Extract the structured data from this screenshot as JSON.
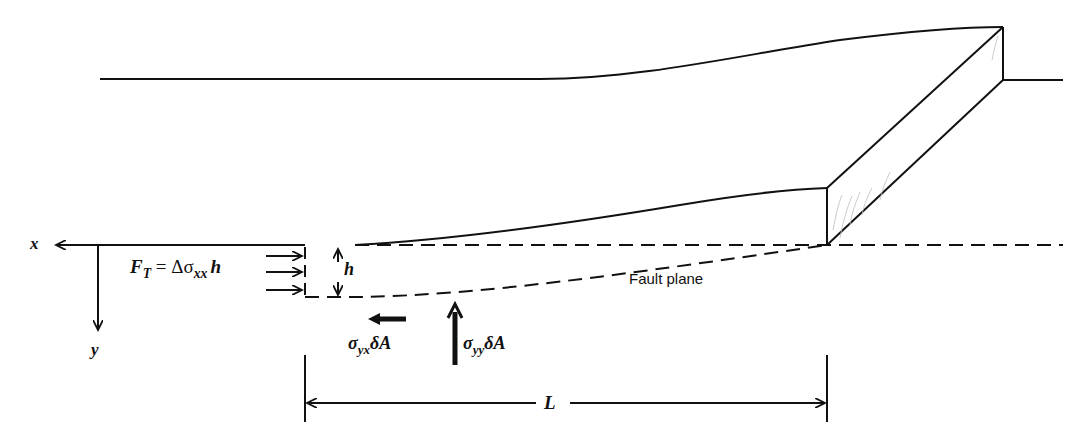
{
  "diagram": {
    "axes": {
      "x_label": "x",
      "y_label": "y"
    },
    "labels": {
      "tectonic_force": {
        "lhs": "F",
        "lhs_sub": "T",
        "eq": " = Δσ",
        "sub": "xx",
        "rhs": "h"
      },
      "thickness": "h",
      "fault_plane": "Fault plane",
      "shear_stress": {
        "sym": "σ",
        "sub": "yx",
        "rest": "δA"
      },
      "normal_stress": {
        "sym": "σ",
        "sub": "yy",
        "rest": "δA"
      },
      "length": "L"
    },
    "colors": {
      "line": "#111111",
      "shading": "#b0b0b0",
      "background": "#ffffff"
    }
  }
}
